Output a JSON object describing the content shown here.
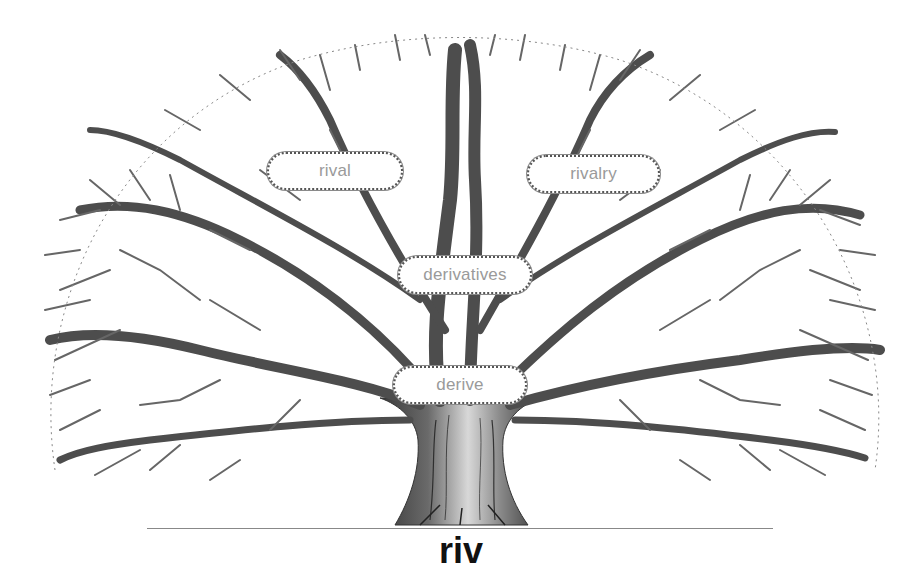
{
  "diagram": {
    "type": "word-family-tree",
    "root": {
      "label": "riv"
    },
    "derived_words": [
      {
        "id": "derive",
        "label": "derive",
        "position": "trunk-top"
      },
      {
        "id": "derivatives",
        "label": "derivatives",
        "position": "center"
      },
      {
        "id": "rival",
        "label": "rival",
        "position": "upper-left"
      },
      {
        "id": "rivalry",
        "label": "rivalry",
        "position": "upper-right"
      }
    ],
    "colors": {
      "pill_text": "#9a9a9a",
      "pill_border": "#555555",
      "branch": "#555555",
      "root_text": "#111111",
      "ground_line": "#888888"
    }
  }
}
